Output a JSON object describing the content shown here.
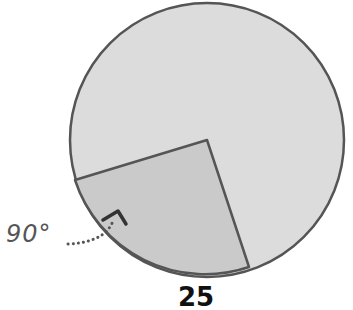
{
  "diagram": {
    "type": "circle-sector",
    "angle_label": "90°",
    "bottom_label": "25",
    "center": [
      207,
      140
    ],
    "radius": 137,
    "sector_start": [
      75,
      180
    ],
    "sector_end": [
      249,
      267
    ],
    "colors": {
      "circle_fill": "#dcdcdc",
      "sector_fill": "#cacaca",
      "stroke": "#555555"
    }
  }
}
